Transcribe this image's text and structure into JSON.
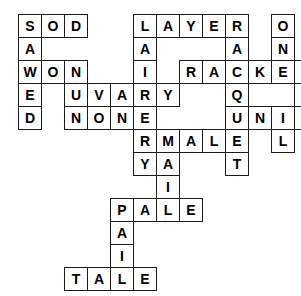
{
  "puzzle": {
    "title": "Crossword grid",
    "type": "filled-crossword",
    "grid": {
      "origin_x": 18,
      "origin_y": 14,
      "cell_size": 23,
      "columns": 15,
      "rows": 12
    },
    "style": {
      "cell_fill": "#ffffff",
      "cell_border": "#1a1a1a",
      "letter_color": "#000000",
      "page_background": "#ffffff",
      "font_size": 14
    },
    "entries_across": [
      {
        "answer": "SOD",
        "row": 0,
        "col": 0
      },
      {
        "answer": "LAYER",
        "row": 0,
        "col": 5
      },
      {
        "answer": "WON",
        "row": 2,
        "col": 0
      },
      {
        "answer": "RACKET",
        "row": 2,
        "col": 7
      },
      {
        "answer": "VARY",
        "row": 3,
        "col": 3
      },
      {
        "answer": "NONE",
        "row": 4,
        "col": 2
      },
      {
        "answer": "NIGHT",
        "row": 4,
        "col": 10
      },
      {
        "answer": "MALE",
        "row": 5,
        "col": 6
      },
      {
        "answer": "PALE",
        "row": 8,
        "col": 4
      },
      {
        "answer": "TALE",
        "row": 11,
        "col": 2
      }
    ],
    "entries_down": [
      {
        "answer": "SAWED",
        "row": 0,
        "col": 0
      },
      {
        "answer": "NUN",
        "row": 2,
        "col": 2
      },
      {
        "answer": "LAIR",
        "row": 0,
        "col": 5
      },
      {
        "answer": "VERY",
        "row": 3,
        "col": 3
      },
      {
        "answer": "RAQUET",
        "row": 0,
        "col": 9
      },
      {
        "answer": "ONTAIL",
        "row": 0,
        "col": 11
      },
      {
        "answer": "KNIGHT",
        "row": 0,
        "col": 13
      },
      {
        "answer": "MAIL",
        "row": 5,
        "col": 6
      },
      {
        "answer": "PAIL",
        "row": 8,
        "col": 4
      }
    ],
    "cells": [
      {
        "r": 0,
        "c": 0,
        "letter": "S"
      },
      {
        "r": 0,
        "c": 1,
        "letter": "O"
      },
      {
        "r": 0,
        "c": 2,
        "letter": "D"
      },
      {
        "r": 0,
        "c": 5,
        "letter": "L"
      },
      {
        "r": 0,
        "c": 6,
        "letter": "A"
      },
      {
        "r": 0,
        "c": 7,
        "letter": "Y"
      },
      {
        "r": 0,
        "c": 8,
        "letter": "E"
      },
      {
        "r": 0,
        "c": 9,
        "letter": "R"
      },
      {
        "r": 0,
        "c": 11,
        "letter": "O"
      },
      {
        "r": 0,
        "c": 13,
        "letter": "K"
      },
      {
        "r": 1,
        "c": 0,
        "letter": "A"
      },
      {
        "r": 1,
        "c": 5,
        "letter": "A"
      },
      {
        "r": 1,
        "c": 9,
        "letter": "A"
      },
      {
        "r": 1,
        "c": 11,
        "letter": "N"
      },
      {
        "r": 1,
        "c": 13,
        "letter": "N"
      },
      {
        "r": 2,
        "c": 0,
        "letter": "W"
      },
      {
        "r": 2,
        "c": 1,
        "letter": "O"
      },
      {
        "r": 2,
        "c": 2,
        "letter": "N"
      },
      {
        "r": 2,
        "c": 5,
        "letter": "I"
      },
      {
        "r": 2,
        "c": 7,
        "letter": "R"
      },
      {
        "r": 2,
        "c": 8,
        "letter": "A"
      },
      {
        "r": 2,
        "c": 9,
        "letter": "C"
      },
      {
        "r": 2,
        "c": 10,
        "letter": "K"
      },
      {
        "r": 2,
        "c": 11,
        "letter": "E"
      },
      {
        "r": 2,
        "c": 12,
        "letter": "T"
      },
      {
        "r": 2,
        "c": 13,
        "letter": "I"
      },
      {
        "r": 3,
        "c": 0,
        "letter": "E"
      },
      {
        "r": 3,
        "c": 2,
        "letter": "U"
      },
      {
        "r": 3,
        "c": 3,
        "letter": "V"
      },
      {
        "r": 3,
        "c": 4,
        "letter": "A"
      },
      {
        "r": 3,
        "c": 5,
        "letter": "R"
      },
      {
        "r": 3,
        "c": 6,
        "letter": "Y"
      },
      {
        "r": 3,
        "c": 9,
        "letter": "Q"
      },
      {
        "r": 3,
        "c": 12,
        "letter": "A"
      },
      {
        "r": 3,
        "c": 13,
        "letter": "G"
      },
      {
        "r": 4,
        "c": 0,
        "letter": "D"
      },
      {
        "r": 4,
        "c": 2,
        "letter": "N"
      },
      {
        "r": 4,
        "c": 3,
        "letter": "O"
      },
      {
        "r": 4,
        "c": 4,
        "letter": "N"
      },
      {
        "r": 4,
        "c": 5,
        "letter": "E"
      },
      {
        "r": 4,
        "c": 9,
        "letter": "U"
      },
      {
        "r": 4,
        "c": 10,
        "letter": "N"
      },
      {
        "r": 4,
        "c": 11,
        "letter": "I"
      },
      {
        "r": 4,
        "c": 12,
        "letter": "G"
      },
      {
        "r": 4,
        "c": 13,
        "letter": "H"
      },
      {
        "r": 4,
        "c": 14,
        "letter": "T"
      },
      {
        "r": 5,
        "c": 5,
        "letter": "R"
      },
      {
        "r": 5,
        "c": 6,
        "letter": "M"
      },
      {
        "r": 5,
        "c": 7,
        "letter": "A"
      },
      {
        "r": 5,
        "c": 8,
        "letter": "L"
      },
      {
        "r": 5,
        "c": 9,
        "letter": "E"
      },
      {
        "r": 5,
        "c": 11,
        "letter": "L"
      },
      {
        "r": 5,
        "c": 13,
        "letter": "T"
      },
      {
        "r": 6,
        "c": 5,
        "letter": "Y"
      },
      {
        "r": 6,
        "c": 6,
        "letter": "A"
      },
      {
        "r": 6,
        "c": 9,
        "letter": "T"
      },
      {
        "r": 7,
        "c": 6,
        "letter": "I"
      },
      {
        "r": 8,
        "c": 4,
        "letter": "P"
      },
      {
        "r": 8,
        "c": 5,
        "letter": "A"
      },
      {
        "r": 8,
        "c": 6,
        "letter": "L"
      },
      {
        "r": 8,
        "c": 7,
        "letter": "E"
      },
      {
        "r": 9,
        "c": 4,
        "letter": "A"
      },
      {
        "r": 10,
        "c": 4,
        "letter": "I"
      },
      {
        "r": 11,
        "c": 2,
        "letter": "T"
      },
      {
        "r": 11,
        "c": 3,
        "letter": "A"
      },
      {
        "r": 11,
        "c": 4,
        "letter": "L"
      },
      {
        "r": 11,
        "c": 5,
        "letter": "E"
      }
    ]
  }
}
